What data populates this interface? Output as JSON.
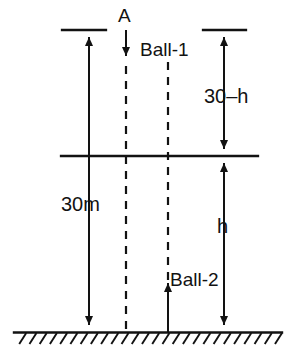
{
  "diagram": {
    "ground": {
      "name": "ground-line",
      "hatch_count": 26
    },
    "labels": {
      "drop_point": "A",
      "ball_1": "Ball-1",
      "ball_2": "Ball-2",
      "total_height": "30m",
      "upper_segment": "30–h",
      "lower_segment": "h"
    },
    "colors": {
      "ink": "#121212",
      "background": "#ffffff"
    },
    "geometry": {
      "total_height_label": "30m",
      "upper_segment_label": "30–h",
      "lower_segment_label": "h",
      "meeting_line_y_note": "horizontal meeting line",
      "ball1_direction": "down",
      "ball2_direction": "up"
    }
  }
}
